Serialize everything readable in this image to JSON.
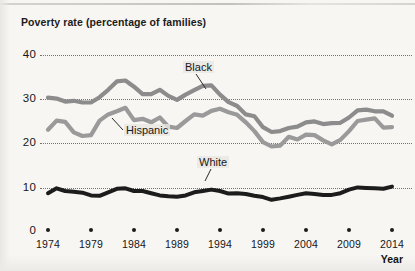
{
  "chart_title": "Poverty rate (percentage of families)",
  "axis": {
    "x_label": "Year",
    "y_ticks": [
      "40",
      "30",
      "20",
      "10",
      "0"
    ],
    "x_ticks": [
      "1974",
      "1979",
      "1984",
      "1989",
      "1994",
      "1999",
      "2004",
      "2009",
      "2014"
    ]
  },
  "series_labels": {
    "black": "Black",
    "hispanic": "Hispanic",
    "white": "White"
  },
  "colors": {
    "black_series": "#8c8c8c",
    "hispanic_series": "#9a9a9a",
    "white_series": "#1c1c1c",
    "grid": "#6f6d68",
    "text": "#171717",
    "page_background": "#f7f6f3"
  },
  "chart_data": {
    "type": "line",
    "title": "Poverty rate (percentage of families)",
    "xlabel": "Year",
    "ylabel": "",
    "xlim": [
      1974,
      2014
    ],
    "ylim": [
      0,
      40
    ],
    "yticks": [
      0,
      10,
      20,
      30,
      40
    ],
    "xticks": [
      1974,
      1979,
      1984,
      1989,
      1994,
      1999,
      2004,
      2009,
      2014
    ],
    "grid": "horizontal-dotted",
    "legend": "inline-labels",
    "x": [
      1974,
      1975,
      1976,
      1977,
      1978,
      1979,
      1980,
      1981,
      1982,
      1983,
      1984,
      1985,
      1986,
      1987,
      1988,
      1989,
      1990,
      1991,
      1992,
      1993,
      1994,
      1995,
      1996,
      1997,
      1998,
      1999,
      2000,
      2001,
      2002,
      2003,
      2004,
      2005,
      2006,
      2007,
      2008,
      2009,
      2010,
      2011,
      2012,
      2013,
      2014
    ],
    "series": [
      {
        "name": "Black",
        "color": "#8c8c8c",
        "values": [
          30.3,
          30.1,
          29.4,
          29.6,
          29.2,
          29.2,
          30.4,
          32.1,
          34.0,
          34.2,
          32.8,
          31.1,
          31.1,
          32.1,
          30.7,
          29.8,
          31.0,
          32.0,
          33.0,
          33.1,
          31.0,
          29.3,
          28.4,
          26.5,
          26.1,
          23.6,
          22.5,
          22.7,
          23.4,
          23.7,
          24.7,
          24.9,
          24.3,
          24.5,
          24.6,
          25.8,
          27.4,
          27.6,
          27.2,
          27.2,
          26.2
        ],
        "labeled_at_x": 1991
      },
      {
        "name": "Hispanic",
        "color": "#9a9a9a",
        "values": [
          23.0,
          25.1,
          24.8,
          22.4,
          21.6,
          21.8,
          25.1,
          26.5,
          27.2,
          28.0,
          25.2,
          25.5,
          24.7,
          25.8,
          23.7,
          23.4,
          25.0,
          26.5,
          26.2,
          27.3,
          27.8,
          27.0,
          26.4,
          24.7,
          22.7,
          20.2,
          19.2,
          19.4,
          21.4,
          20.8,
          21.9,
          21.8,
          20.6,
          19.7,
          20.7,
          22.7,
          25.0,
          25.3,
          25.6,
          23.5,
          23.6
        ],
        "labeled_at_x": 1979
      },
      {
        "name": "White",
        "color": "#1c1c1c",
        "values": [
          8.6,
          9.7,
          9.1,
          8.9,
          8.7,
          8.1,
          8.0,
          8.8,
          9.6,
          9.7,
          9.1,
          9.1,
          8.6,
          8.1,
          7.9,
          7.8,
          8.1,
          8.8,
          9.1,
          9.4,
          9.1,
          8.5,
          8.6,
          8.4,
          8.0,
          7.7,
          7.1,
          7.4,
          7.8,
          8.2,
          8.6,
          8.4,
          8.2,
          8.2,
          8.6,
          9.4,
          9.9,
          9.8,
          9.7,
          9.6,
          10.1
        ],
        "note": "black line, lowest series"
      }
    ]
  }
}
